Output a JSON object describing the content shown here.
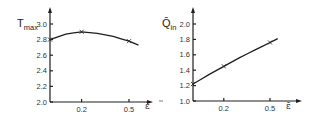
{
  "chart_data": [
    {
      "type": "line",
      "title": "",
      "xlabel": "ε̄",
      "ylabel": "T_max",
      "ylabel_main": "T",
      "ylabel_sub": "max",
      "xlim": [
        0,
        0.6
      ],
      "ylim": [
        2.0,
        3.0
      ],
      "x_ticks": [
        0.2,
        0.5
      ],
      "x_tick_labels": [
        "0.2",
        "0.5"
      ],
      "y_ticks": [
        2.0,
        2.2,
        2.4,
        2.6,
        2.8,
        3.0
      ],
      "y_tick_labels": [
        "2.0",
        "2.2",
        "2.4",
        "2.6",
        "2.8",
        "3.0"
      ],
      "grid": false,
      "legend": null,
      "series": [
        {
          "name": "T_max",
          "marked_points": {
            "x": [
              0.0,
              0.2,
              0.5
            ],
            "y": [
              2.8,
              2.9,
              2.78
            ]
          },
          "curve": {
            "x": [
              0.0,
              0.1,
              0.2,
              0.3,
              0.4,
              0.5,
              0.56
            ],
            "y": [
              2.8,
              2.87,
              2.9,
              2.88,
              2.84,
              2.78,
              2.73
            ]
          }
        }
      ]
    },
    {
      "type": "line",
      "title": "",
      "xlabel": "ε̄",
      "ylabel": "Q̄_in",
      "ylabel_main": "Q̄",
      "ylabel_sub": "in",
      "xlim": [
        0,
        0.7
      ],
      "ylim": [
        1.0,
        2.0
      ],
      "x_ticks": [
        0.2,
        0.5
      ],
      "x_tick_labels": [
        "0.2",
        "0.5"
      ],
      "y_ticks": [
        1.0,
        1.2,
        1.4,
        1.6,
        1.8,
        2.0
      ],
      "y_tick_labels": [
        "1.0",
        "1.2",
        "1.4",
        "1.6",
        "1.8",
        "2.0"
      ],
      "grid": false,
      "legend": null,
      "series": [
        {
          "name": "Q_in",
          "marked_points": {
            "x": [
              0.0,
              0.2,
              0.5
            ],
            "y": [
              1.22,
              1.45,
              1.76
            ]
          },
          "curve": {
            "x": [
              0.0,
              0.1,
              0.2,
              0.3,
              0.4,
              0.5,
              0.55
            ],
            "y": [
              1.22,
              1.34,
              1.45,
              1.56,
              1.66,
              1.76,
              1.81
            ]
          }
        }
      ]
    }
  ]
}
